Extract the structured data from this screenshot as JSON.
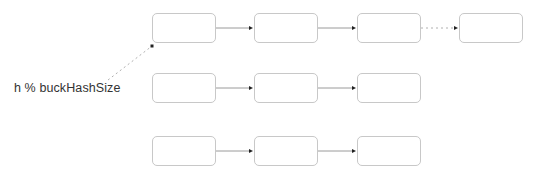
{
  "diagram": {
    "title": "",
    "label": "h % buckHashSize",
    "colors": {
      "node_border": "#c8c8c8",
      "edge": "#9a9a9a",
      "arrowhead": "#222222",
      "dotted": "#b0b0b0",
      "text": "#333333"
    },
    "node_size": {
      "width": 64,
      "height": 30
    },
    "rows": [
      {
        "y": 13,
        "nodes": [
          152,
          254,
          357,
          459
        ],
        "edges": [
          "solid",
          "solid",
          "dotted"
        ]
      },
      {
        "y": 73,
        "nodes": [
          152,
          254,
          357
        ],
        "edges": [
          "solid",
          "solid"
        ]
      },
      {
        "y": 136,
        "nodes": [
          152,
          254,
          357
        ],
        "edges": [
          "solid",
          "solid"
        ]
      }
    ],
    "pointer": {
      "from": [
        108,
        80
      ],
      "to": [
        152,
        46
      ],
      "style": "dotted"
    }
  }
}
